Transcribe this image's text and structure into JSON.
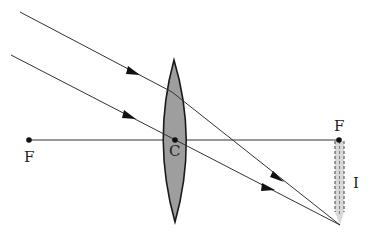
{
  "diagram": {
    "colors": {
      "line": "#333333",
      "lens_fill": "#9e9e9e",
      "lens_stroke": "#1a1a1a",
      "image_fill": "#d9d9d9",
      "point": "#111111",
      "background": "#ffffff"
    },
    "labels": {
      "focus_left": "F",
      "center": "C",
      "focus_right": "F",
      "image": "I"
    },
    "points": {
      "focus_left": [
        29,
        140
      ],
      "center": [
        175,
        140
      ],
      "focus_right": [
        339,
        140
      ],
      "image_tip": [
        340,
        225
      ]
    },
    "lens": {
      "top": [
        174,
        60
      ],
      "bottom": [
        175,
        222
      ],
      "half_width": 16
    },
    "rays": [
      {
        "name": "upper-ray",
        "path": [
          [
            20,
            12
          ],
          [
            172,
            92
          ],
          [
            340,
            225
          ]
        ],
        "arrows": [
          [
            135,
            72
          ],
          [
            280,
            178
          ]
        ]
      },
      {
        "name": "central-ray",
        "path": [
          [
            11,
            55
          ],
          [
            175,
            140
          ],
          [
            340,
            225
          ]
        ],
        "arrows": [
          [
            130,
            117
          ],
          [
            270,
            189
          ]
        ]
      }
    ],
    "image": {
      "top": [
        339,
        140
      ],
      "bottom": [
        340,
        225
      ],
      "width": 9
    }
  }
}
